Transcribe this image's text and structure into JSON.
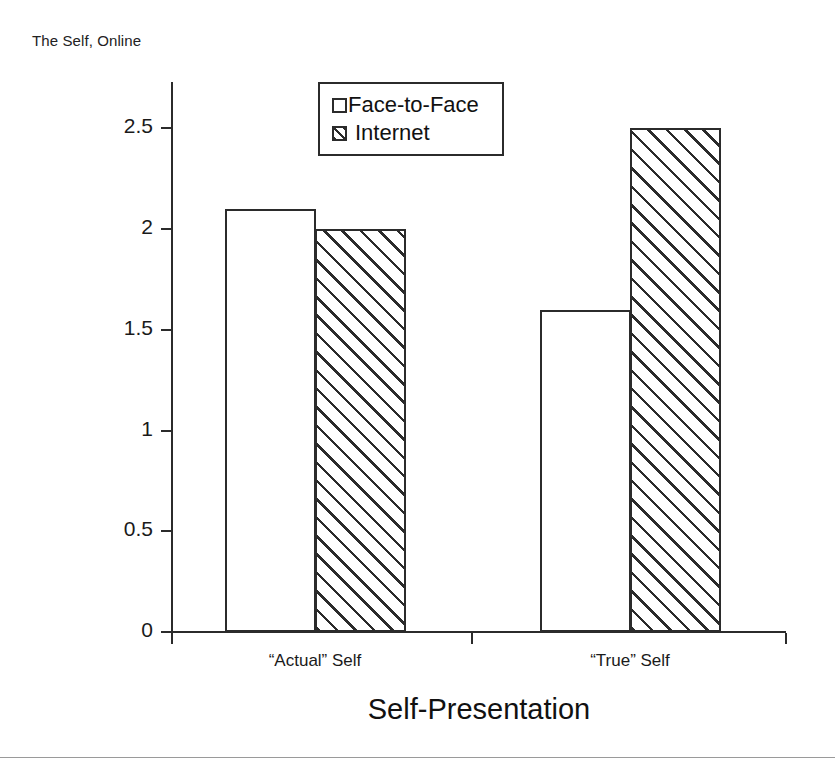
{
  "header": {
    "caption": "The Self, Online"
  },
  "chart_data": {
    "type": "bar",
    "title": "",
    "categories": [
      "“Actual” Self",
      "“True” Self"
    ],
    "series": [
      {
        "name": "Face-to-Face",
        "values": [
          2.1,
          1.6
        ],
        "fill": "white",
        "pattern": "none"
      },
      {
        "name": "Internet",
        "values": [
          2.0,
          2.5
        ],
        "fill": "white",
        "pattern": "diagonal-hatch"
      }
    ],
    "xlabel": "Self-Presentation",
    "ylabel": "Number of Matches",
    "ylim": [
      0,
      2.7
    ],
    "yticks": [
      0,
      0.5,
      1,
      1.5,
      2,
      2.5
    ],
    "ytick_labels": [
      "0",
      "0.5",
      "1",
      "1.5",
      "2",
      "2.5"
    ],
    "grid": false,
    "legend_position": "top-center",
    "legend_entries": [
      "Face-to-Face",
      "Internet"
    ],
    "colors": {
      "line": "#2b2b2b",
      "fill": "#ffffff",
      "text": "#1a1a1a"
    }
  }
}
